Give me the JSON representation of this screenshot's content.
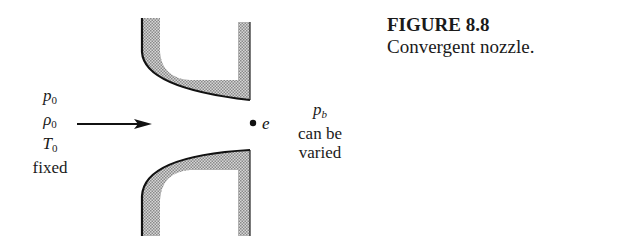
{
  "caption": {
    "figure_number": "FIGURE 8.8",
    "title": "Convergent nozzle."
  },
  "inlet": {
    "pressure": {
      "symbol": "p",
      "subscript": "0"
    },
    "density": {
      "symbol": "ρ",
      "subscript": "0"
    },
    "temperature": {
      "symbol": "T",
      "subscript": "0"
    },
    "note": "fixed"
  },
  "exit": {
    "label": "e"
  },
  "outlet": {
    "pressure": {
      "symbol": "p",
      "subscript": "b"
    },
    "note_line1": "can be",
    "note_line2": "varied"
  },
  "colors": {
    "wall_fill": "#b8b8b8",
    "ink": "#111111"
  }
}
